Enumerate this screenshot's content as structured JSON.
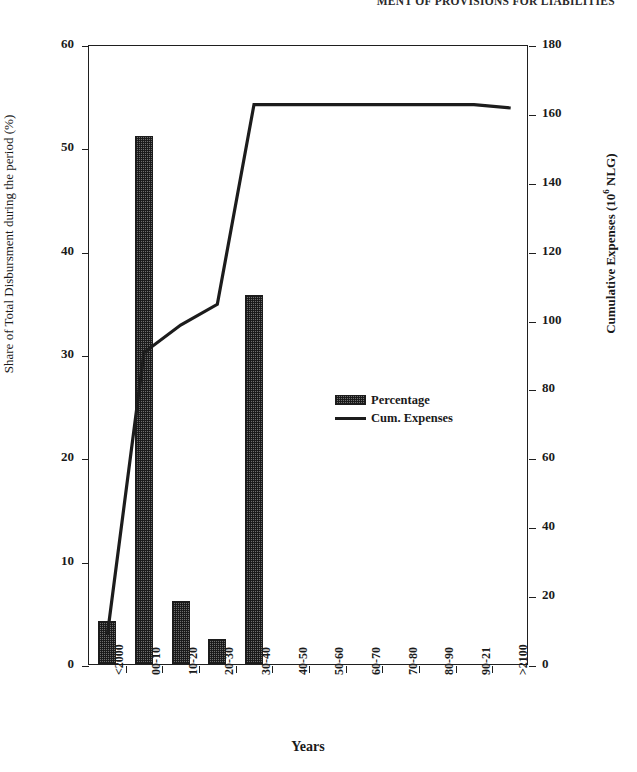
{
  "header": {
    "running_title": "MENT OF PROVISIONS FOR LIABILITIES"
  },
  "figure": {
    "x_title": "Years",
    "y_left_title": "Share of Total Disbursment during the period (%)",
    "y_right_title_pre": "Cumulative Expenses (10",
    "y_right_title_sup": "6",
    "y_right_title_post": " NLG)"
  },
  "legend": {
    "position": "inside-center",
    "entries": [
      {
        "label": "Percentage",
        "marker": "hatched-bar",
        "color": "#6e6e6e"
      },
      {
        "label": "Cum. Expenses",
        "marker": "line",
        "color": "#1c1c1c"
      }
    ]
  },
  "chart_data": {
    "type": "bar",
    "title": "",
    "subtitle": "",
    "xlabel": "Years",
    "ylabel": "Share of Total Disbursment during the period (%)",
    "y2label": "Cumulative Expenses (10^6 NLG)",
    "grid": false,
    "categories": [
      "<2000",
      "00-10",
      "10-20",
      "20-30",
      "30-40",
      "40-50",
      "50-60",
      "60-70",
      "70-80",
      "80-90",
      "90-21",
      ">2100"
    ],
    "ylim": [
      0,
      60
    ],
    "yticks": [
      0,
      10,
      20,
      30,
      40,
      50,
      60
    ],
    "y2lim": [
      0,
      180
    ],
    "y2ticks": [
      0,
      20,
      40,
      60,
      80,
      100,
      120,
      140,
      160,
      180
    ],
    "series": [
      {
        "name": "Percentage",
        "type": "bar",
        "axis": "left",
        "color": "#6e6e6e",
        "values": [
          4.2,
          51.1,
          6.1,
          2.4,
          35.7,
          0,
          0,
          0,
          0,
          0,
          0,
          0
        ]
      },
      {
        "name": "Cum. Expenses",
        "type": "line",
        "axis": "right",
        "color": "#1c1c1c",
        "values": [
          9,
          91,
          99,
          105,
          163,
          163,
          163,
          163,
          163,
          163,
          163,
          162
        ]
      }
    ]
  }
}
